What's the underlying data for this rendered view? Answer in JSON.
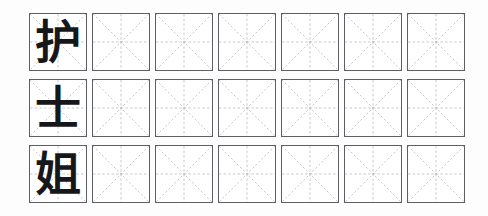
{
  "worksheet": {
    "type": "chinese-character-handwriting-practice",
    "grid_style": "mizige",
    "word": "护士姐",
    "rows_count": 3,
    "columns_count": 7,
    "colors": {
      "page_background": "#fdfdfd",
      "cell_background": "#ffffff",
      "cell_border": "#5d5f63",
      "guide_line": "#b9b9bd",
      "glyph": "#16171a"
    },
    "rows": [
      {
        "model_character": "护",
        "cells": [
          "护",
          "",
          "",
          "",
          "",
          "",
          ""
        ]
      },
      {
        "model_character": "士",
        "cells": [
          "士",
          "",
          "",
          "",
          "",
          "",
          ""
        ]
      },
      {
        "model_character": "姐",
        "cells": [
          "姐",
          "",
          "",
          "",
          "",
          "",
          ""
        ]
      }
    ]
  }
}
